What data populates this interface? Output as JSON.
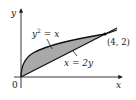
{
  "axes": {
    "x_label": "x",
    "y_label": "y",
    "origin_label": "0"
  },
  "curves": [
    {
      "name": "parabola",
      "label": "y² = x",
      "label_base": "y",
      "label_sup": "2",
      "label_rest": " = x"
    },
    {
      "name": "line",
      "label": "x = 2y"
    }
  ],
  "intersection": {
    "label": "(4, 2)"
  },
  "region": {
    "fill": "#a9a9a9",
    "stroke": "#111111"
  }
}
